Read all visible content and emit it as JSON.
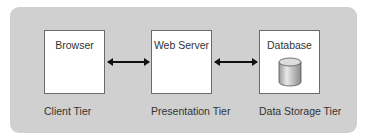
{
  "diagram": {
    "background_color": "#d0d0d0",
    "nodes": [
      {
        "id": "browser",
        "label": "Browser",
        "tier": "Client Tier"
      },
      {
        "id": "web-server",
        "label": "Web Server",
        "tier": "Presentation Tier"
      },
      {
        "id": "database",
        "label": "Database",
        "tier": "Data Storage Tier",
        "icon": "database-cylinder-icon"
      }
    ],
    "edges": [
      {
        "from": "browser",
        "to": "web-server",
        "direction": "bidirectional"
      },
      {
        "from": "web-server",
        "to": "database",
        "direction": "bidirectional"
      }
    ]
  }
}
